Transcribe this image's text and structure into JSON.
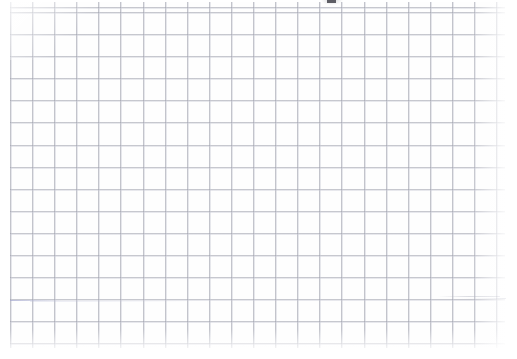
{
  "document": {
    "kind": "scanned-blank-grid-paper",
    "title": "",
    "visible_text": "",
    "page": {
      "width": 517,
      "height": 359,
      "background_color": "#ffffff"
    }
  },
  "grid": {
    "name": "square-ruled-grid",
    "cell_size_px": 22,
    "line_color": "#9ea0ac",
    "ghost_line_color": "#c4c6d2",
    "origin_x": 10,
    "origin_y": 12,
    "columns": 23,
    "rows": 16,
    "right_margin_px": 12,
    "bottom_margin_px": 11,
    "left_margin_px": 10,
    "top_margin_px": 2
  },
  "artifacts": {
    "items": [
      {
        "name": "clipped-glyph-top-edge",
        "description": "small dark mark clipped by the top edge of the scan",
        "x": 327,
        "y": 0,
        "width": 9,
        "height": 3,
        "color": "#4a4a52"
      },
      {
        "name": "stray-stroke-left",
        "description": "faint blue-gray horizontal smudge",
        "x": 10,
        "y": 300,
        "width": 52,
        "color": "#969bcd"
      },
      {
        "name": "stray-stroke-right",
        "description": "faint gray horizontal smudge",
        "x": 438,
        "y": 296,
        "width": 62,
        "color": "#b2b4c0"
      }
    ]
  }
}
